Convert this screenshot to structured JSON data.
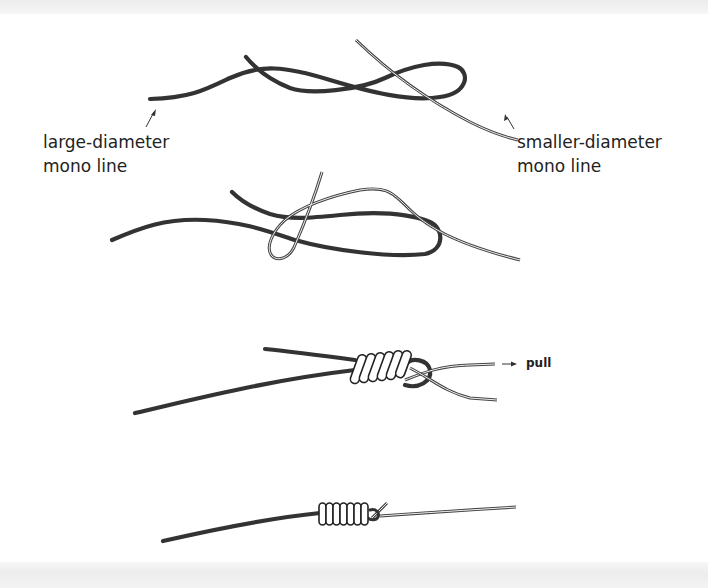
{
  "figure": {
    "colors": {
      "background": "#ffffff",
      "line_thick": "#333333",
      "line_thin_outline": "#444444",
      "coil_fill": "#ffffff",
      "text": "#222222"
    },
    "labels": {
      "large_line": {
        "line1": "large-diameter",
        "line2": "mono line"
      },
      "small_line": {
        "line1": "smaller-diameter",
        "line2": "mono line"
      },
      "pull": "pull"
    },
    "steps": [
      {
        "index": 1,
        "description": "Thick line forms a loop; thin line laid through the loop"
      },
      {
        "index": 2,
        "description": "Thin line doubled back forming a loop around the thick line"
      },
      {
        "index": 3,
        "description": "Thin line wrapped around the thick line in coils",
        "coil_count": 6,
        "annotation": "pull"
      },
      {
        "index": 4,
        "description": "Knot tightened; coils snugged down",
        "coil_count": 7
      }
    ]
  }
}
